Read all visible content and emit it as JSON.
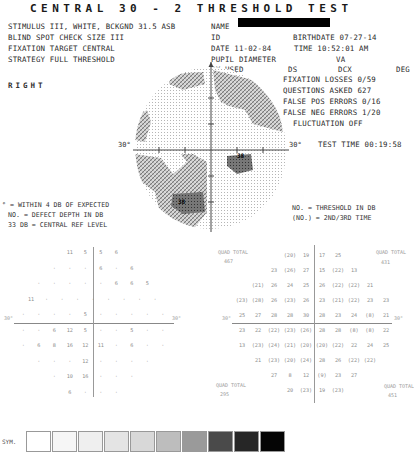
{
  "title": "CENTRAL 30 - 2 THRESHOLD TEST",
  "header": {
    "stimulus": "STIMULUS   III, WHITE, BCKGND 31.5 ASB",
    "name_label": "NAME",
    "blind_spot": "BLIND SPOT CHECK SIZE  III",
    "id_label": "ID",
    "birthdate": "BIRTHDATE  07-27-14",
    "fixation_target": "FIXATION TARGET    CENTRAL",
    "date": "DATE  11-02-84",
    "time": "TIME  10:52:01 AM",
    "strategy": "STRATEGY   FULL THRESHOLD",
    "pupil_diameter": "PUPIL DIAMETER",
    "va": "VA",
    "rx_used": "RX USED",
    "ds": "DS",
    "dcx": "DCX",
    "deg": "DEG"
  },
  "eye": "RIGHT",
  "reliability": {
    "fixation_losses": "FIXATION LOSSES  0/59",
    "questions_asked": "QUESTIONS ASKED  627",
    "false_pos": "FALSE POS ERRORS 0/16",
    "false_neg": "FALSE NEG ERRORS 1/20",
    "fluctuation": "FLUCTUATION  OFF",
    "test_time": "TEST TIME 00:19:58"
  },
  "grayscale_map": {
    "axis_label_left": "30°",
    "axis_label_right": "30°",
    "defect_labels": [
      "38",
      "38"
    ]
  },
  "legend_left": {
    "line1": "° = WITHIN 4 DB OF EXPECTED",
    "line2": "NO. = DEFECT DEPTH IN DB",
    "line3": "33 DB     = CENTRAL REF LEVEL"
  },
  "legend_right": {
    "line1": "NO.  = THRESHOLD IN DB",
    "line2": "(NO.) = 2ND/3RD TIME"
  },
  "defect_grid": {
    "axis_left": "30°",
    "axis_right": "30°",
    "rows": [
      [
        "11",
        "5",
        "5",
        "6"
      ],
      [
        "·",
        "·",
        "·",
        "6",
        "·",
        "6"
      ],
      [
        "·",
        "·",
        "·",
        "·",
        "·",
        "6",
        "6",
        "5"
      ],
      [
        "11",
        "·",
        "·",
        "·",
        "·",
        "·",
        "·",
        "·",
        "·"
      ],
      [
        "·",
        "·",
        "·",
        "·",
        "5",
        "·",
        "·",
        "·",
        "·",
        "·"
      ],
      [
        "·",
        "·",
        "6",
        "12",
        "5",
        "·",
        "·",
        "5",
        "·",
        "·"
      ],
      [
        "·",
        "6",
        "8",
        "16",
        "12",
        "11",
        "·",
        "6",
        "·",
        "·"
      ],
      [
        "·",
        "·",
        "·",
        "12",
        "·",
        "·",
        "·",
        "·"
      ],
      [
        "·",
        "10",
        "16",
        "·",
        "·",
        "·"
      ],
      [
        "6",
        "·",
        "·",
        "·"
      ]
    ]
  },
  "threshold_grid": {
    "axis_left": "30°",
    "axis_right": "30°",
    "quad_totals": {
      "upper_left_label": "QUAD TOTAL",
      "upper_left": "467",
      "upper_right_label": "QUAD TOTAL",
      "upper_right": "431",
      "lower_left_label": "QUAD TOTAL",
      "lower_left": "295",
      "lower_right_label": "QUAD TOTAL",
      "lower_right": "451"
    },
    "rows": [
      [
        "(20)",
        "19",
        "17",
        "25"
      ],
      [
        "23",
        "(26)",
        "27",
        "15",
        "(22)",
        "13"
      ],
      [
        "(21)",
        "26",
        "24",
        "25",
        "26",
        "(22)",
        "(22)",
        "21"
      ],
      [
        "(23)",
        "(28)",
        "26",
        "(23)",
        "26",
        "23",
        "(21)",
        "(22)",
        "23",
        "23"
      ],
      [
        "25",
        "27",
        "28",
        "28",
        "30",
        "28",
        "23",
        "24",
        "(8)",
        "21"
      ],
      [
        "23",
        "22",
        "(22)",
        "(23)",
        "(26)",
        "28",
        "28",
        "(8)",
        "(8)",
        "22"
      ],
      [
        "13",
        "(23)",
        "(24)",
        "(21)",
        "(20)",
        "(20)",
        "(22)",
        "22",
        "24",
        "25"
      ],
      [
        "21",
        "(23)",
        "(20)",
        "(24)",
        "28",
        "26",
        "(22)",
        "(22)"
      ],
      [
        "27",
        "8",
        "12",
        "(9)",
        "23",
        "27"
      ],
      [
        "20",
        "(23)",
        "19",
        "(23)"
      ]
    ]
  },
  "symbol_legend": {
    "label": "SYM.",
    "shades": [
      "#ffffff",
      "#f6f6f6",
      "#efefef",
      "#e4e4e4",
      "#d8d8d8",
      "#bdbdbd",
      "#9a9a9a",
      "#4a4a4a",
      "#262626",
      "#050505"
    ]
  }
}
